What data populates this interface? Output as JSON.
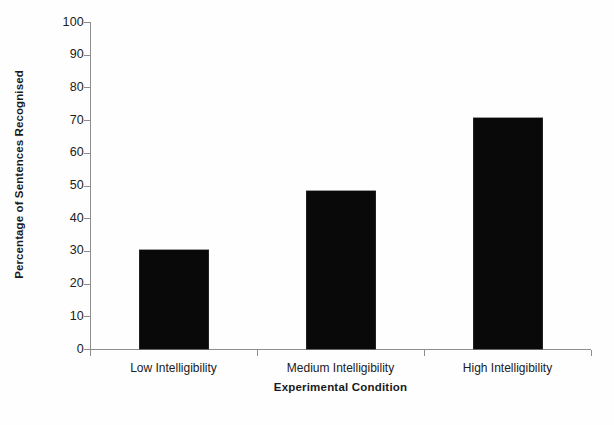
{
  "chart_data": {
    "type": "bar",
    "title": "",
    "subtitle": "",
    "categories": [
      "Low Intelligibility",
      "Medium Intelligibility",
      "High Intelligibility"
    ],
    "values": [
      30.3,
      48.3,
      70.5
    ],
    "xlabel": "Experimental Condition",
    "ylabel": "Percentage of Sentences Recognised",
    "ylim": [
      0,
      100
    ],
    "ytick_step": 10,
    "yticks": [
      0,
      10,
      20,
      30,
      40,
      50,
      60,
      70,
      80,
      90,
      100
    ],
    "ytick_labels": [
      "0",
      "10",
      "20",
      "30",
      "40",
      "50",
      "60",
      "70",
      "80",
      "90",
      "100"
    ],
    "grid": false,
    "legend": null,
    "bar_color": "#090909",
    "axis_color": "#8d8d8d",
    "background_color": "#fefefe",
    "series": [
      {
        "name": "Percentage of Sentences Recognised",
        "values": [
          30.3,
          48.3,
          70.5
        ]
      }
    ]
  }
}
